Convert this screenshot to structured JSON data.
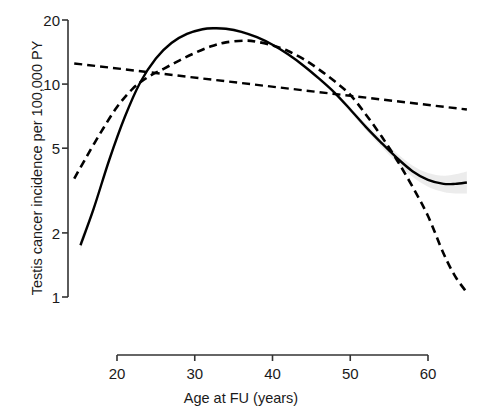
{
  "chart_data": {
    "type": "line",
    "title": "",
    "xlabel": "Age at FU (years)",
    "ylabel": "Testis cancer incidence per 100,000 PY",
    "yscale": "log",
    "xscale": "linear",
    "xlim": [
      14.5,
      65.0
    ],
    "ylim": [
      1.0,
      20.0
    ],
    "xticks": [
      20,
      30,
      40,
      50,
      60
    ],
    "xtick_labels": [
      "20",
      "30",
      "40",
      "50",
      "60"
    ],
    "yticks": [
      1,
      2,
      5,
      10,
      20
    ],
    "ytick_labels": [
      "1",
      "2",
      "5",
      "10",
      "20"
    ],
    "grid": false,
    "legend": "none",
    "series": [
      {
        "name": "solid-spline",
        "style": "solid",
        "color": "#000000",
        "linewidth": 2.4,
        "has_confidence_band": true,
        "band_color": "#e8e8e8",
        "x": [
          15.3,
          17,
          19,
          21,
          23,
          25,
          27,
          29,
          31,
          32.5,
          34,
          36,
          38,
          40,
          42,
          44,
          46,
          48,
          50,
          52,
          54,
          56,
          58,
          60,
          62,
          63.5,
          65
        ],
        "y": [
          1.75,
          2.6,
          4.4,
          7.0,
          10.2,
          13.2,
          15.6,
          17.2,
          18.1,
          18.3,
          18.2,
          17.6,
          16.6,
          15.3,
          13.8,
          12.2,
          10.6,
          9.1,
          7.6,
          6.3,
          5.3,
          4.5,
          3.9,
          3.55,
          3.4,
          3.4,
          3.45
        ]
      },
      {
        "name": "dashed-spline",
        "style": "dashed",
        "color": "#000000",
        "linewidth": 2.6,
        "has_confidence_band": false,
        "x": [
          14.5,
          16,
          18,
          20,
          22,
          24,
          26,
          28,
          30,
          32,
          34,
          36.5,
          38,
          40,
          42,
          44,
          46,
          48,
          50,
          52,
          54,
          56,
          58,
          60,
          62,
          63.5,
          65
        ],
        "y": [
          3.6,
          4.5,
          6.0,
          7.8,
          9.5,
          10.8,
          11.8,
          12.9,
          14.0,
          15.0,
          15.7,
          16.0,
          15.8,
          15.2,
          14.3,
          13.1,
          11.7,
          10.3,
          8.9,
          7.2,
          5.7,
          4.4,
          3.3,
          2.4,
          1.6,
          1.25,
          1.05
        ]
      },
      {
        "name": "dashed-linear-trend",
        "style": "dashed",
        "color": "#000000",
        "linewidth": 2.4,
        "has_confidence_band": false,
        "x": [
          14.5,
          65.0
        ],
        "y": [
          12.5,
          7.6
        ]
      }
    ],
    "annotations": []
  },
  "axes": {
    "y_title": "Testis cancer incidence per 100,000 PY",
    "x_title": "Age at FU (years)",
    "y_tick_labels": [
      "20",
      "10",
      "5",
      "2",
      "1"
    ],
    "x_tick_labels": [
      "20",
      "30",
      "40",
      "50",
      "60"
    ]
  },
  "colors": {
    "line": "#000000",
    "axis": "#333333",
    "band": "#e9e9e9",
    "background": "#ffffff",
    "text": "#1a1a1a"
  }
}
